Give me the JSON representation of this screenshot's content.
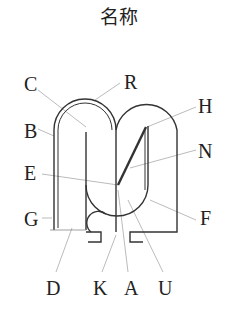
{
  "title": "名称",
  "labels": {
    "C": "C",
    "R": "R",
    "H": "H",
    "B": "B",
    "N": "N",
    "E": "E",
    "F": "F",
    "G": "G",
    "D": "D",
    "K": "K",
    "A": "A",
    "U": "U"
  },
  "colors": {
    "stroke": "#333333",
    "leader": "#aaaaaa",
    "text": "#222222"
  }
}
